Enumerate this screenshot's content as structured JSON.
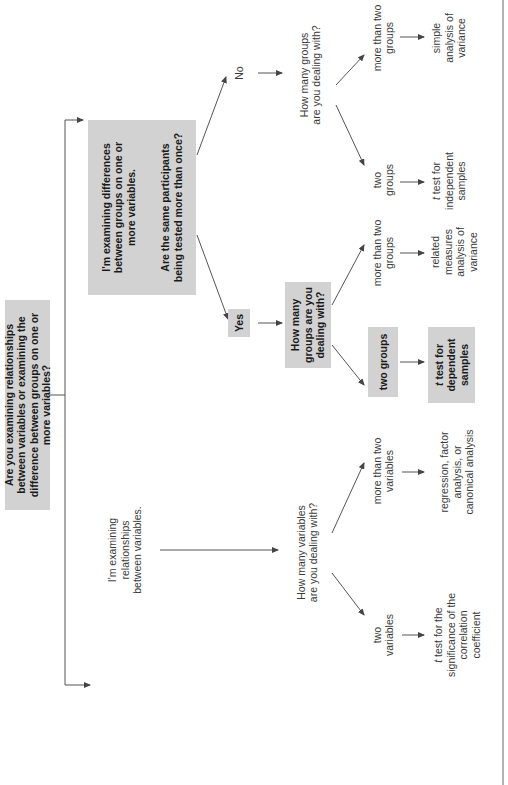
{
  "diagram": {
    "root": "Are you examining relationships between variables or examining the difference between groups on one or more variables?",
    "differences": {
      "statement": "I'm examining differences between groups on one or more variables.",
      "question": "Are the same participants being tested more than once?"
    },
    "relationships": "I'm examining relationships between variables.",
    "yes_label": "Yes",
    "no_label": "No",
    "yes_branch": {
      "question": "How many groups are you dealing with?",
      "two": "two groups",
      "two_result_t": "t",
      "two_result": " test for dependent samples",
      "more": "more than two groups",
      "more_result": "related measures analysis of variance"
    },
    "no_branch": {
      "question": "How many groups are you dealing with?",
      "two": "two groups",
      "two_result_t": "t",
      "two_result": " test for independent samples",
      "more": "more than two groups",
      "more_result": "simple analysis of variance"
    },
    "variables_branch": {
      "question": "How many variables are you dealing with?",
      "two": "two variables",
      "two_result_t": "t",
      "two_result": " test for the significance of the correlation coefficient",
      "more": "more than two variables",
      "more_result": "regression, factor analysis, or canonical analysis"
    },
    "colors": {
      "box_fill": "#d2d2d2",
      "line": "#444444",
      "text": "#2a2a2a"
    }
  }
}
